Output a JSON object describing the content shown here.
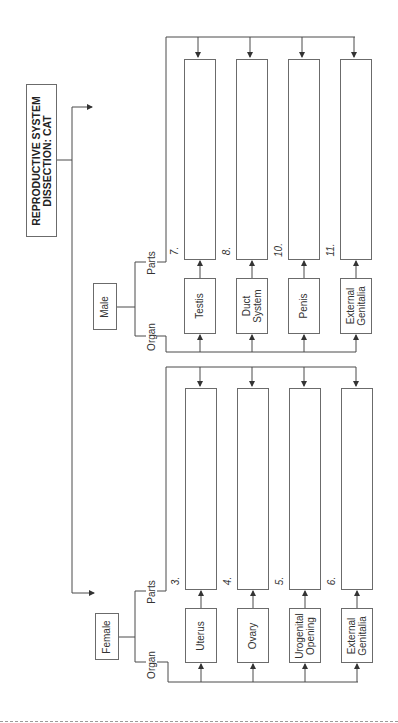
{
  "title": {
    "line1": "REPRODUCTIVE SYSTEM",
    "line2": "DISSECTION: CAT"
  },
  "branches": {
    "male": {
      "label": "Male",
      "organ_label": "Organ",
      "parts_label": "Parts",
      "organs": [
        {
          "name": "Testis",
          "number": "7.",
          "parts": ""
        },
        {
          "name": "Duct System",
          "number": "8.",
          "parts": ""
        },
        {
          "name": "Penis",
          "number": "10.",
          "parts": ""
        },
        {
          "name": "External Genitalia",
          "number": "11.",
          "parts": ""
        }
      ]
    },
    "female": {
      "label": "Female",
      "organ_label": "Organ",
      "parts_label": "Parts",
      "organs": [
        {
          "name": "Uterus",
          "number": "3.",
          "parts": ""
        },
        {
          "name": "Ovary",
          "number": "4.",
          "parts": ""
        },
        {
          "name": "Urogenital Opening",
          "number": "5.",
          "parts": ""
        },
        {
          "name": "External Genitalia",
          "number": "6.",
          "parts": ""
        }
      ]
    }
  },
  "colors": {
    "line": "#4a4a4a",
    "box_border": "#6b6b6b",
    "dash": "#9a9a9a"
  }
}
